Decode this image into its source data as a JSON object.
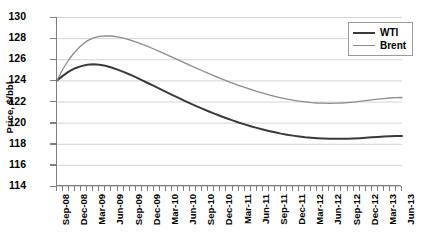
{
  "chart_data": {
    "type": "line",
    "title": "",
    "xlabel": "",
    "ylabel": "Price, $/bbl",
    "ylim": [
      114,
      130
    ],
    "ytick_step": 2,
    "yticks": [
      130,
      128,
      126,
      124,
      122,
      120,
      118,
      116,
      114
    ],
    "grid": true,
    "legend_position": "top-right",
    "x": [
      "Sep-08",
      "Oct-08",
      "Nov-08",
      "Dec-08",
      "Jan-09",
      "Feb-09",
      "Mar-09",
      "Apr-09",
      "May-09",
      "Jun-09",
      "Jul-09",
      "Aug-09",
      "Sep-09",
      "Oct-09",
      "Nov-09",
      "Dec-09",
      "Jan-10",
      "Feb-10",
      "Mar-10",
      "Apr-10",
      "May-10",
      "Jun-10",
      "Jul-10",
      "Aug-10",
      "Sep-10",
      "Oct-10",
      "Nov-10",
      "Dec-10",
      "Jan-11",
      "Feb-11",
      "Mar-11",
      "Apr-11",
      "May-11",
      "Jun-11",
      "Jul-11",
      "Aug-11",
      "Sep-11",
      "Oct-11",
      "Nov-11",
      "Dec-11",
      "Jan-12",
      "Feb-12",
      "Mar-12",
      "Apr-12",
      "May-12",
      "Jun-12",
      "Jul-12",
      "Aug-12",
      "Sep-12",
      "Oct-12",
      "Nov-12",
      "Dec-12",
      "Jan-13",
      "Feb-13",
      "Mar-13",
      "Apr-13",
      "May-13",
      "Jun-13"
    ],
    "xtick_labels": [
      "Sep-08",
      "Dec-08",
      "Mar-09",
      "Jun-09",
      "Sep-09",
      "Dec-09",
      "Mar-10",
      "Jun-10",
      "Sep-10",
      "Dec-10",
      "Mar-11",
      "Jun-11",
      "Sep-11",
      "Dec-11",
      "Mar-12",
      "Jun-12",
      "Sep-12",
      "Dec-12",
      "Mar-13",
      "Jun-13"
    ],
    "xtick_label_interval": 3,
    "series": [
      {
        "name": "WTI",
        "color": "#3a3a3a",
        "width": 2.0,
        "values": [
          124.0,
          124.45,
          124.85,
          125.15,
          125.35,
          125.48,
          125.52,
          125.48,
          125.38,
          125.22,
          125.02,
          124.8,
          124.56,
          124.3,
          124.03,
          123.75,
          123.47,
          123.19,
          122.91,
          122.63,
          122.36,
          122.09,
          121.83,
          121.57,
          121.32,
          121.08,
          120.85,
          120.63,
          120.41,
          120.21,
          120.01,
          119.83,
          119.66,
          119.5,
          119.35,
          119.21,
          119.08,
          118.96,
          118.86,
          118.77,
          118.69,
          118.62,
          118.57,
          118.53,
          118.5,
          118.48,
          118.47,
          118.47,
          118.48,
          118.5,
          118.53,
          118.57,
          118.61,
          118.65,
          118.68,
          118.71,
          118.73,
          118.74
        ]
      },
      {
        "name": "Brent",
        "color": "#8c8c8c",
        "width": 1.3,
        "values": [
          124.0,
          125.1,
          126.0,
          126.72,
          127.3,
          127.74,
          128.02,
          128.17,
          128.22,
          128.2,
          128.12,
          128.0,
          127.84,
          127.65,
          127.44,
          127.21,
          126.97,
          126.72,
          126.46,
          126.2,
          125.94,
          125.68,
          125.42,
          125.16,
          124.91,
          124.66,
          124.42,
          124.19,
          123.96,
          123.74,
          123.53,
          123.33,
          123.14,
          122.96,
          122.79,
          122.63,
          122.48,
          122.35,
          122.23,
          122.12,
          122.03,
          121.96,
          121.9,
          121.86,
          121.84,
          121.83,
          121.84,
          121.86,
          121.9,
          121.95,
          122.01,
          122.08,
          122.15,
          122.22,
          122.28,
          122.33,
          122.36,
          122.38
        ]
      }
    ]
  },
  "legend": {
    "items": [
      {
        "label": "WTI"
      },
      {
        "label": "Brent"
      }
    ]
  }
}
